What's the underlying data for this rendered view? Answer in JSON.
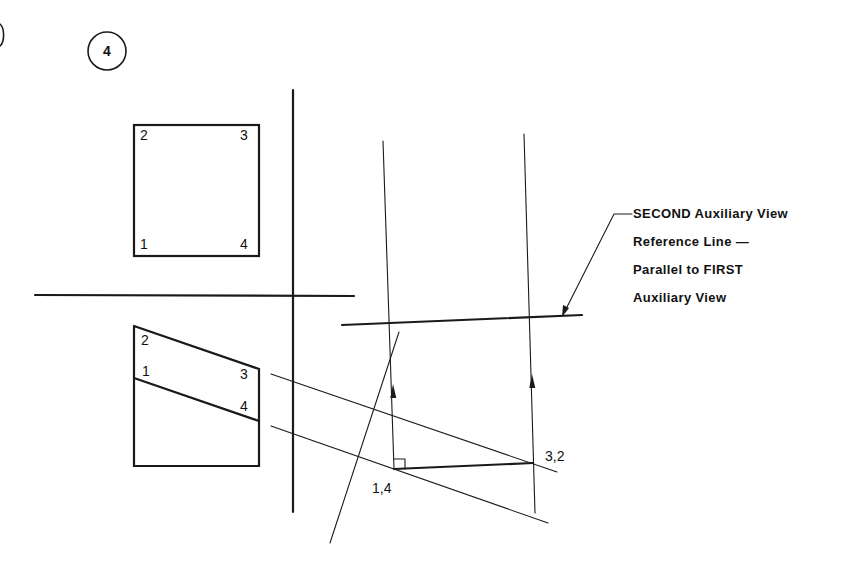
{
  "step": {
    "number": "4"
  },
  "top_view": {
    "corner_labels": [
      "2",
      "3",
      "1",
      "4"
    ]
  },
  "front_view": {
    "point_labels": [
      "2",
      "1",
      "3",
      "4"
    ]
  },
  "auxiliary_view": {
    "point_labels": {
      "left": "1,4",
      "right": "3,2"
    }
  },
  "annotation": {
    "lines": [
      "SECOND Auxiliary View",
      "Reference Line —",
      "Parallel  to FIRST",
      "Auxiliary View"
    ]
  },
  "colors": {
    "ink": "#1a1a1a",
    "background": "#ffffff"
  }
}
